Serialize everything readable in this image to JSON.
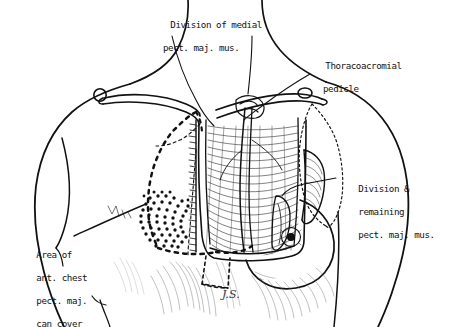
{
  "figure": {
    "background_color": "#ffffff",
    "ink_color": "#111111",
    "signature": "J.S."
  },
  "labels": {
    "top": {
      "line1": "Division of medial",
      "line2": "pect. maj. mus."
    },
    "thoracoacromial": {
      "line1": "Thoracoacromial",
      "line2": "pedicle"
    },
    "division_remaining": {
      "line1": "Division &",
      "line2": "remaining",
      "line3": "pect. maj. mus."
    },
    "area": {
      "line1": "Area of",
      "line2": "ant. chest",
      "line3": "pect. maj.",
      "line4": "can cover"
    }
  },
  "anatomy": {
    "parts": [
      "neck",
      "left-shoulder",
      "right-shoulder",
      "left-clavicle",
      "right-clavicle",
      "acromioclavicular-joint-left",
      "acromioclavicular-joint-right",
      "pectoralis-major-muscle",
      "thoracoacromial-pedicle",
      "right-breast",
      "areola",
      "sternum",
      "stippled-skin-paddle",
      "dashed-flap-outline",
      "dotted-deltopectoral-outline"
    ]
  }
}
